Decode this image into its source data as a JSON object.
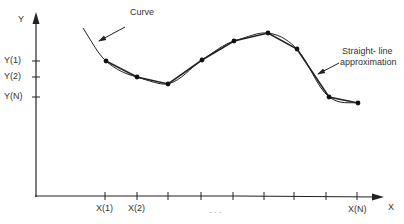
{
  "axes": {
    "y_label": "Y",
    "x_label": "X",
    "y_ticks": [
      "Y(1)",
      "Y(2)",
      "Y(N)"
    ],
    "x_ticks": [
      "X(1)",
      "X(2)",
      "X(N)"
    ],
    "ellipsis": ". . ."
  },
  "annotations": {
    "curve": "Curve",
    "approx_line1": "Straight- line",
    "approx_line2": "approximation"
  },
  "colors": {
    "ink": "#222222",
    "text": "#333333"
  },
  "points": [
    [
      106,
      61
    ],
    [
      137,
      77
    ],
    [
      168,
      84
    ],
    [
      202,
      60
    ],
    [
      234,
      41
    ],
    [
      268,
      33
    ],
    [
      297,
      49
    ],
    [
      329,
      97
    ],
    [
      358,
      103
    ]
  ]
}
